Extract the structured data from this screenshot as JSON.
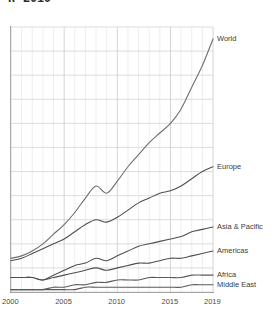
{
  "chart_title": "IP  2019",
  "chart_data": {
    "type": "line",
    "title": "IP  2019",
    "xlabel": "",
    "ylabel": "",
    "grid": true,
    "legend_position": "right-inline",
    "xlim": [
      2000,
      2019
    ],
    "ylim": [
      0,
      110
    ],
    "x": [
      2000,
      2001,
      2002,
      2003,
      2004,
      2005,
      2006,
      2007,
      2008,
      2009,
      2010,
      2011,
      2012,
      2013,
      2014,
      2015,
      2016,
      2017,
      2018,
      2019
    ],
    "xtick_labels": [
      "2000",
      "2005",
      "2010",
      "2015",
      "2019"
    ],
    "xtick_values": [
      2000,
      2005,
      2010,
      2015,
      2019
    ],
    "series": [
      {
        "name": "World",
        "color": "#6e6e6e",
        "label_y_value": 105,
        "values": [
          14,
          15,
          17,
          20,
          24,
          28,
          33,
          39,
          44,
          41,
          46,
          52,
          57,
          62,
          66,
          70,
          76,
          85,
          94,
          105
        ]
      },
      {
        "name": "Europe",
        "color": "#4f4f4f",
        "label_y_value": 52,
        "values": [
          13,
          14,
          16,
          18,
          20,
          22,
          25,
          28,
          30,
          29,
          31,
          34,
          37,
          39,
          41,
          42,
          44,
          47,
          50,
          52
        ]
      },
      {
        "name": "Asia & Pacific",
        "color": "#4f4f4f",
        "label_y_value": 27,
        "values": [
          6,
          6,
          6,
          5,
          7,
          9,
          11,
          12,
          14,
          13,
          15,
          17,
          19,
          20,
          21,
          22,
          23,
          25,
          26,
          27
        ]
      },
      {
        "name": "Americas",
        "color": "#4f4f4f",
        "label_y_value": 17,
        "values": [
          6,
          6,
          6,
          5,
          6,
          7,
          8,
          9,
          10,
          9,
          10,
          11,
          12,
          12,
          13,
          14,
          14,
          15,
          16,
          17
        ]
      },
      {
        "name": "Africa",
        "color": "#5a5a5a",
        "label_y_value": 7,
        "values": [
          1,
          1,
          1,
          1,
          2,
          2,
          3,
          3,
          4,
          4,
          5,
          5,
          5,
          6,
          6,
          6,
          6,
          7,
          7,
          7
        ]
      },
      {
        "name": "Middle East",
        "color": "#5a5a5a",
        "label_y_value": 3,
        "values": [
          1,
          1,
          1,
          1,
          1,
          1,
          1,
          2,
          2,
          2,
          2,
          2,
          2,
          2,
          2,
          2,
          2,
          3,
          3,
          3
        ]
      }
    ]
  },
  "axis": {
    "ticks": [
      {
        "label": "2000",
        "value": 2000
      },
      {
        "label": "2005",
        "value": 2005
      },
      {
        "label": "2010",
        "value": 2010
      },
      {
        "label": "2015",
        "value": 2015
      },
      {
        "label": "2019",
        "value": 2019
      }
    ]
  },
  "colors": {
    "grid_minor": "#e3e3e3",
    "grid_major": "#cfcfcf",
    "axis": "#8d8d8d",
    "text": "#3c3c3c",
    "background": "#ffffff"
  }
}
